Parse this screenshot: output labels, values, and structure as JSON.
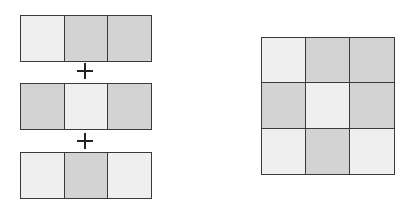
{
  "diagram": {
    "colors": {
      "light": "#efefef",
      "dark": "#d3d3d3",
      "border": "#3a3a3a"
    },
    "strips": [
      {
        "cells": [
          "light",
          "dark",
          "dark"
        ]
      },
      {
        "cells": [
          "dark",
          "light",
          "dark"
        ]
      },
      {
        "cells": [
          "light",
          "dark",
          "light"
        ]
      }
    ],
    "operator": "+",
    "result_grid": [
      [
        "light",
        "dark",
        "dark"
      ],
      [
        "dark",
        "light",
        "dark"
      ],
      [
        "light",
        "dark",
        "light"
      ]
    ]
  }
}
